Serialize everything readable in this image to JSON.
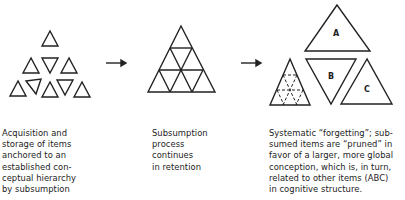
{
  "stages": [
    {
      "id": "acquisition",
      "caption_lines": [
        "Acquisition and",
        "storage of items",
        "anchored to an",
        "established con-",
        "ceptual hierarchy",
        "by subsumption"
      ]
    },
    {
      "id": "subsumption",
      "caption_lines": [
        "Subsumption",
        "process",
        "continues",
        "in retention"
      ]
    },
    {
      "id": "forgetting",
      "caption_lines": [
        "Systematic “forgetting”; sub-",
        "sumed items are “pruned” in",
        "favor of a larger, more global",
        "conception, which is, in turn,",
        "related to other items (ABC)",
        "in cognitive structure."
      ],
      "item_labels": {
        "a": "A",
        "b": "B",
        "c": "C"
      }
    }
  ],
  "arrows": [
    "right-arrow",
    "right-arrow"
  ],
  "colors": {
    "stroke": "#222222",
    "background": "#ffffff"
  }
}
